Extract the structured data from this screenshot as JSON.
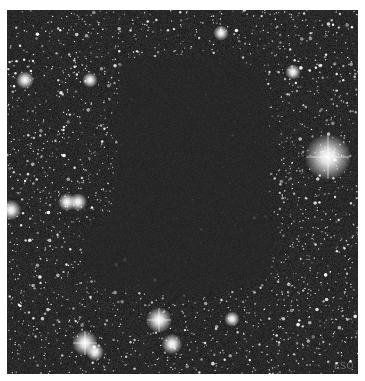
{
  "image": {
    "subject": "dark nebula star field",
    "credit": "ESO",
    "frame": {
      "x": 7,
      "y": 10,
      "width": 351,
      "height": 364
    },
    "colors": {
      "border": "#ffffff",
      "sky": "#262626",
      "nebula": "#2b2b2b",
      "star": "#ffffff"
    }
  },
  "render": {
    "seed": 68,
    "field_star_count": 2600,
    "nebula_polygon": [
      [
        118,
        50
      ],
      [
        175,
        45
      ],
      [
        228,
        48
      ],
      [
        255,
        62
      ],
      [
        262,
        110
      ],
      [
        262,
        180
      ],
      [
        270,
        230
      ],
      [
        262,
        265
      ],
      [
        225,
        282
      ],
      [
        160,
        285
      ],
      [
        100,
        278
      ],
      [
        75,
        262
      ],
      [
        80,
        225
      ],
      [
        105,
        200
      ],
      [
        110,
        150
      ],
      [
        112,
        90
      ]
    ],
    "bright_stars": [
      {
        "x": 321,
        "y": 147,
        "r": 9
      },
      {
        "x": 152,
        "y": 310,
        "r": 5
      },
      {
        "x": 78,
        "y": 333,
        "r": 5
      },
      {
        "x": 165,
        "y": 334,
        "r": 4
      },
      {
        "x": 88,
        "y": 342,
        "r": 3.5
      },
      {
        "x": 4,
        "y": 200,
        "r": 4
      },
      {
        "x": 60,
        "y": 192,
        "r": 3.5
      },
      {
        "x": 71,
        "y": 192,
        "r": 3.5
      },
      {
        "x": 18,
        "y": 70,
        "r": 3.5
      },
      {
        "x": 83,
        "y": 70,
        "r": 3
      },
      {
        "x": 225,
        "y": 309,
        "r": 3
      },
      {
        "x": 214,
        "y": 23,
        "r": 3
      },
      {
        "x": 286,
        "y": 62,
        "r": 3
      }
    ]
  }
}
